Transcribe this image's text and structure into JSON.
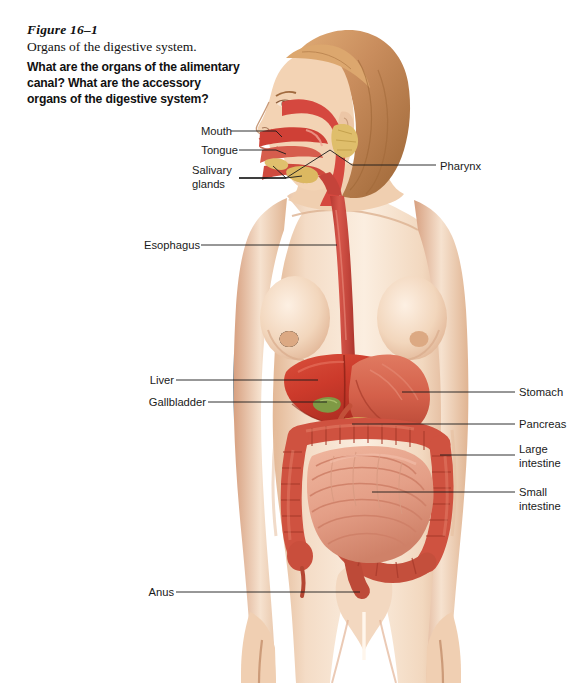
{
  "figure": {
    "number": "Figure 16–1",
    "title": "Organs of the digestive system.",
    "question": "What are the organs of the alimentary canal? What are the accessory organs of the digestive system?"
  },
  "labels": {
    "left": [
      {
        "name": "mouth",
        "text": "Mouth",
        "x": 192,
        "y": 130
      },
      {
        "name": "tongue",
        "text": "Tongue",
        "x": 192,
        "y": 149
      },
      {
        "name": "salivary-glands",
        "text": "Salivary\nglands",
        "x": 192,
        "y": 168
      },
      {
        "name": "esophagus",
        "text": "Esophagus",
        "x": 140,
        "y": 239
      },
      {
        "name": "liver",
        "text": "Liver",
        "x": 142,
        "y": 373
      },
      {
        "name": "gallbladder",
        "text": "Gallbladder",
        "x": 142,
        "y": 395
      },
      {
        "name": "anus",
        "text": "Anus",
        "x": 142,
        "y": 585
      }
    ],
    "right": [
      {
        "name": "pharynx",
        "text": "Pharynx",
        "x": 440,
        "y": 159
      },
      {
        "name": "stomach",
        "text": "Stomach",
        "x": 519,
        "y": 385
      },
      {
        "name": "pancreas",
        "text": "Pancreas",
        "x": 519,
        "y": 417
      },
      {
        "name": "large-intestine",
        "text": "Large\nintestine",
        "x": 519,
        "y": 442
      },
      {
        "name": "small-intestine",
        "text": "Small\nintestine",
        "x": 519,
        "y": 485
      }
    ]
  },
  "colors": {
    "skin": "#f6ddc6",
    "skin_shadow": "#e8bd9c",
    "skin_deep": "#d79b77",
    "hair": "#c98d5d",
    "hair_dark": "#a06a3e",
    "liver": "#cf3b2c",
    "liver_dark": "#a62a20",
    "stomach": "#d4604a",
    "esophagus": "#c9493f",
    "pharynx": "#d5483f",
    "large_intestine": "#cf5240",
    "large_intestine_dark": "#a83b2c",
    "small_intestine": "#e8a48e",
    "small_intestine_dark": "#cf8068",
    "gallbladder": "#7f9a45",
    "pancreas": "#d9b45c",
    "salivary": "#dfbe6b",
    "leader": "#1a1a1a",
    "background": "#ffffff"
  },
  "art": {
    "subject": "female-anatomical-figure-frontal-with-head-in-profile",
    "view": "anterior view of woman with digestive organs overlaid"
  }
}
